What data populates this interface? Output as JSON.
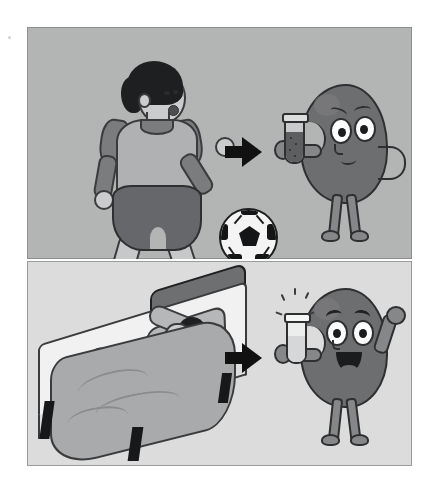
{
  "illustration": {
    "title": "Urine sample comparison: after exercise versus after rest",
    "style": "hand-drawn grayscale cartoon, two stacked panels",
    "canvas": {
      "width": 439,
      "height": 493,
      "background": "#ffffff"
    }
  },
  "colors": {
    "page_background": "#ffffff",
    "panel_top_background": "#b3b4b4",
    "panel_bottom_background": "#dcdcdc",
    "panel_border": "#8d8e8e",
    "ink_outline": "#2e2f31",
    "kidney_body": "#6d6e70",
    "arrow": "#111111",
    "skin": "#cbcccd",
    "hair": "#1e1f21",
    "jersey_body": "#b0b1b2",
    "jersey_sleeves": "#7b7c7e",
    "shorts": "#66676a",
    "shoe": "#4a4b4d",
    "ball_white": "#f4f4f4",
    "ball_black": "#141516",
    "bed_frame": "#17181a",
    "mattress": "#f1f1f1",
    "blanket": "#a9aaab",
    "headboard": "#6e6f71",
    "tube_cloudy_fill": "#5d5e60",
    "tube_clear_fill": "#d6d7d8"
  },
  "panels": [
    {
      "id": "panel-top",
      "name": "after-exercise-panel",
      "background": "#b3b4b4",
      "caption_alt": "A boy playing soccer leads to a kidney holding a cloudy, dark urine sample and looking worried.",
      "subjects": {
        "person": {
          "name": "soccer-player",
          "activity": "playing soccer",
          "pose": "running, about to kick the ball",
          "hair": "short dark hair",
          "clothing": [
            "raglan jersey with dark sleeves",
            "dark shorts",
            "striped knee socks",
            "dark cleats"
          ],
          "expression": "mouth open, exerting effort"
        },
        "object": {
          "name": "soccer-ball",
          "description": "black-and-white panelled football"
        },
        "arrow": {
          "name": "result-arrow",
          "direction": "right",
          "glyph": "right-arrow"
        },
        "kidney": {
          "name": "sad-kidney-character",
          "mood": "worried",
          "face": [
            "sad slanted eyebrows",
            "large round eyes",
            "small frowning mouth"
          ],
          "posture": "one hand on hip, other hand holding a test tube",
          "sample": {
            "name": "cloudy-urine-sample",
            "container": "test tube",
            "appearance": "dark and cloudy with visible particles",
            "fill_level_percent": 65,
            "sparkles": false
          }
        }
      }
    },
    {
      "id": "panel-bottom",
      "name": "after-rest-panel",
      "background": "#dcdcdc",
      "caption_alt": "A person resting asleep in bed leads to a kidney holding a clear, sparkling urine sample and smiling.",
      "subjects": {
        "person": {
          "name": "sleeping-person",
          "activity": "resting in bed",
          "pose": "lying on back, one arm behind head",
          "hair": "dark hair on pillow",
          "expression": "asleep, eyes closed"
        },
        "object": {
          "name": "bed",
          "parts": [
            "headboard",
            "mattress",
            "pillow",
            "blanket",
            "four dark legs"
          ]
        },
        "arrow": {
          "name": "result-arrow",
          "direction": "right",
          "glyph": "right-arrow"
        },
        "kidney": {
          "name": "happy-kidney-character",
          "mood": "happy",
          "face": [
            "raised curved eyebrows",
            "large round eyes",
            "wide open smiling mouth"
          ],
          "posture": "one arm raised in celebration, other hand holding a test tube",
          "sample": {
            "name": "clear-urine-sample",
            "container": "test tube",
            "appearance": "clear and clean",
            "fill_level_percent": 55,
            "sparkles": true,
            "sparkle_count": 5
          }
        }
      }
    }
  ],
  "comparison": {
    "top_label_alt": "Exercise",
    "bottom_label_alt": "Rest",
    "meaning_alt": "Strenuous activity makes the urine sample look abnormal; rest makes it look normal."
  }
}
